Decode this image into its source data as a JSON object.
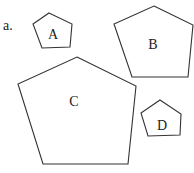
{
  "problem_label": "a.",
  "shapes": [
    {
      "label": "A",
      "points": "49,13 72,24 70,47 42,48 33,24",
      "lx": 53,
      "ly": 39
    },
    {
      "label": "B",
      "points": "154,6 193,25 188,77 132,77 114,24",
      "lx": 153,
      "ly": 49
    },
    {
      "label": "C",
      "points": "77,57 136,86 128,164 43,164 18,84",
      "lx": 74,
      "ly": 106
    },
    {
      "label": "D",
      "points": "160,100 181,114 180,135 148,136 141,113",
      "lx": 162,
      "ly": 130
    }
  ],
  "colors": {
    "stroke": "#333333",
    "text": "#222222"
  }
}
